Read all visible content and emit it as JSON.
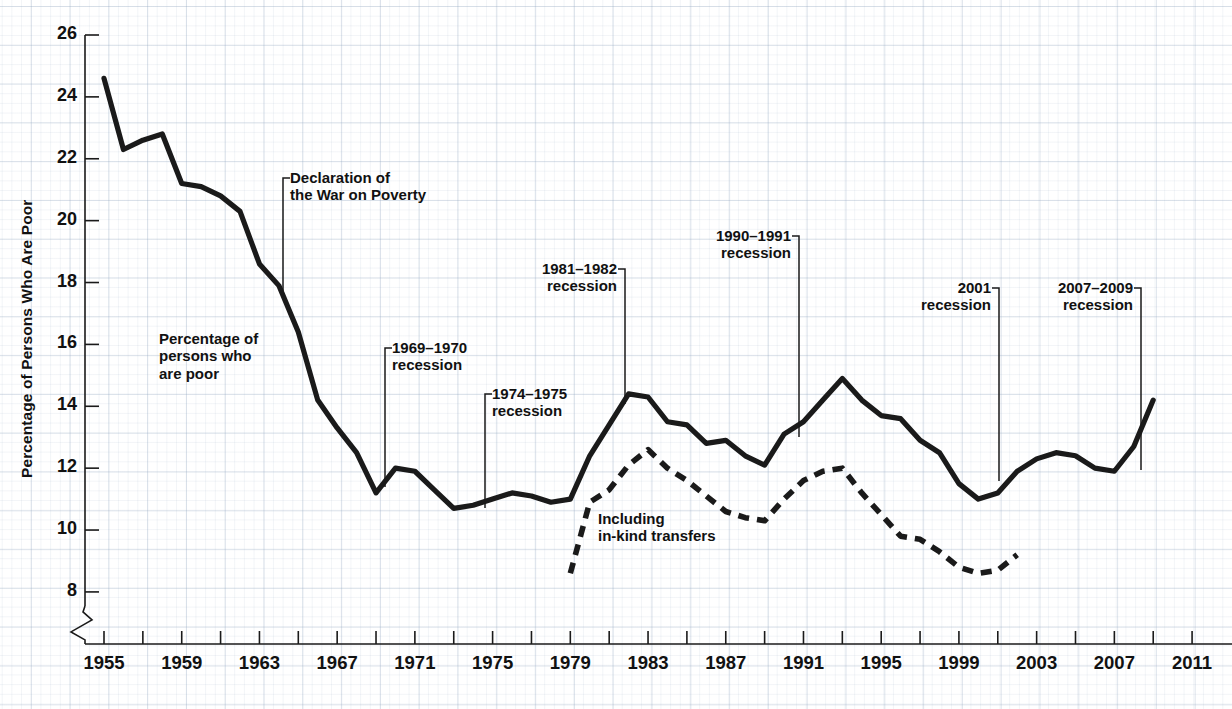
{
  "chart_data": {
    "type": "line",
    "title": "",
    "xlabel": "",
    "ylabel": "Percentage of Persons Who Are Poor",
    "xlim": [
      1954,
      2012
    ],
    "ylim": [
      7.3,
      26
    ],
    "y_axis_break": true,
    "grid": true,
    "legend_position": "inline-annotations",
    "y_ticks": [
      8,
      10,
      12,
      14,
      16,
      18,
      20,
      22,
      24,
      26
    ],
    "x_ticks": [
      1955,
      1957,
      1959,
      1961,
      1963,
      1965,
      1967,
      1969,
      1971,
      1973,
      1975,
      1977,
      1979,
      1981,
      1983,
      1985,
      1987,
      1989,
      1991,
      1993,
      1995,
      1997,
      1999,
      2001,
      2003,
      2005,
      2007,
      2009,
      2011
    ],
    "x_tick_labels": [
      1955,
      1959,
      1963,
      1967,
      1971,
      1975,
      1979,
      1983,
      1987,
      1991,
      1995,
      1999,
      2003,
      2007,
      2011
    ],
    "series": [
      {
        "name": "Percentage of persons who are poor",
        "style": "solid",
        "color": "#1a1a1a",
        "x": [
          1955,
          1956,
          1957,
          1958,
          1959,
          1960,
          1961,
          1962,
          1963,
          1964,
          1965,
          1966,
          1967,
          1968,
          1969,
          1970,
          1971,
          1972,
          1973,
          1974,
          1975,
          1976,
          1977,
          1978,
          1979,
          1980,
          1981,
          1982,
          1983,
          1984,
          1985,
          1986,
          1987,
          1988,
          1989,
          1990,
          1991,
          1992,
          1993,
          1994,
          1995,
          1996,
          1997,
          1998,
          1999,
          2000,
          2001,
          2002,
          2003,
          2004,
          2005,
          2006,
          2007,
          2008,
          2009
        ],
        "values": [
          24.6,
          22.3,
          22.6,
          22.8,
          21.2,
          21.1,
          20.8,
          20.3,
          18.6,
          17.9,
          16.4,
          14.2,
          13.3,
          12.5,
          11.2,
          12.0,
          11.9,
          11.3,
          10.7,
          10.8,
          11.0,
          11.2,
          11.1,
          10.9,
          11.0,
          12.4,
          13.4,
          14.4,
          14.3,
          13.5,
          13.4,
          12.8,
          12.9,
          12.4,
          12.1,
          13.1,
          13.5,
          14.2,
          14.9,
          14.2,
          13.7,
          13.6,
          12.9,
          12.5,
          11.5,
          11.0,
          11.2,
          11.9,
          12.3,
          12.5,
          12.4,
          12.0,
          11.9,
          12.7,
          14.2
        ]
      },
      {
        "name": "Including in-kind transfers",
        "style": "dashed",
        "color": "#1a1a1a",
        "x": [
          1979,
          1980,
          1981,
          1982,
          1983,
          1984,
          1985,
          1986,
          1987,
          1988,
          1989,
          1990,
          1991,
          1992,
          1993,
          1994,
          1995,
          1996,
          1997,
          1998,
          1999,
          2000,
          2001,
          2002
        ],
        "values": [
          8.6,
          10.9,
          11.3,
          12.1,
          12.6,
          12.0,
          11.6,
          11.1,
          10.6,
          10.4,
          10.3,
          11.0,
          11.6,
          11.9,
          12.0,
          11.2,
          10.5,
          9.8,
          9.7,
          9.3,
          8.8,
          8.6,
          8.7,
          9.2
        ]
      }
    ],
    "annotations": [
      {
        "id": "war-on-poverty",
        "text_lines": [
          "Declaration of",
          "the War on Poverty"
        ],
        "year": 1964,
        "align": "left",
        "label_x": 290,
        "label_y": 170,
        "leader_x": 283,
        "leader_y_top": 178,
        "leader_y_bottom": 297
      },
      {
        "id": "recession-1969-1970",
        "text_lines": [
          "1969–1970",
          "recession"
        ],
        "year": 1969,
        "align": "left",
        "label_x": 392,
        "label_y": 340,
        "leader_x": 385,
        "leader_y_top": 348,
        "leader_y_bottom": 487
      },
      {
        "id": "recession-1974-1975",
        "text_lines": [
          "1974–1975",
          "recession"
        ],
        "year": 1975,
        "align": "left",
        "label_x": 492,
        "label_y": 386,
        "leader_x": 485,
        "leader_y_top": 394,
        "leader_y_bottom": 508
      },
      {
        "id": "recession-1981-1982",
        "text_lines": [
          "1981–1982",
          "recession"
        ],
        "year": 1982,
        "align": "right",
        "label_x": 499,
        "label_y": 261,
        "leader_x": 625,
        "leader_y_top": 269,
        "leader_y_bottom": 404
      },
      {
        "id": "recession-1990-1991",
        "text_lines": [
          "1990–1991",
          "recession"
        ],
        "year": 1991,
        "align": "right",
        "label_x": 673,
        "label_y": 228,
        "leader_x": 799,
        "leader_y_top": 236,
        "leader_y_bottom": 437
      },
      {
        "id": "recession-2001",
        "text_lines": [
          "2001",
          "recession"
        ],
        "year": 2001,
        "align": "right",
        "label_x": 905,
        "label_y": 280,
        "leader_x": 999,
        "leader_y_top": 288,
        "leader_y_bottom": 481
      },
      {
        "id": "recession-2007-2009",
        "text_lines": [
          "2007–2009",
          "recession"
        ],
        "year": 2007,
        "align": "right",
        "label_x": 1021,
        "label_y": 280,
        "leader_x": 1141,
        "leader_y_top": 288,
        "leader_y_bottom": 470
      }
    ],
    "series_labels": [
      {
        "id": "poor-label",
        "text_lines": [
          "Percentage of",
          "persons who",
          "are poor"
        ],
        "x": 159,
        "y": 330
      },
      {
        "id": "in-kind-label",
        "text_lines": [
          "Including",
          "in-kind transfers"
        ],
        "x": 598,
        "y": 510
      }
    ]
  },
  "colors": {
    "line": "#1a1a1a",
    "axis": "#1a1a1a",
    "grid_major": "#96aac3",
    "grid_minor": "#c8d4e2",
    "text": "#111111",
    "background": "#ffffff"
  },
  "top_strip": {
    "text": ""
  }
}
